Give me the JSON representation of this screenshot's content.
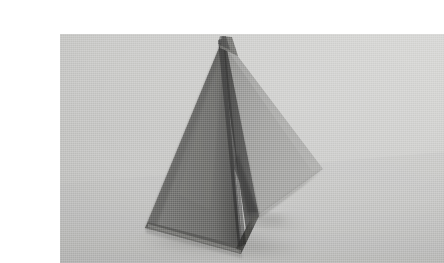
{
  "page": {
    "width": 424,
    "height": 262,
    "background_color": "#ffffff",
    "caption": ""
  },
  "photo": {
    "alt_text": "Folded paper pyramid standing on a plain surface",
    "subject": "origami-pyramid",
    "frame": {
      "x": 20,
      "y": 18,
      "width": 384,
      "height": 229
    },
    "palette": {
      "paper_white": "#ffffff",
      "background_light": "#d3d3d1",
      "background_mid": "#c6c6c4",
      "background_dark": "#b4b4b2",
      "face_left_dark": "#6f6f6d",
      "face_left_darker": "#5d5d5c",
      "face_right_mid": "#9a9a98",
      "face_right_light": "#a8a8a6",
      "inner_wedge": "#4a4a49",
      "crease_shadow": "#3a3a39",
      "ground_shadow": "#9d9d9b"
    },
    "geometry": {
      "apex": [
        183,
        22
      ],
      "left_base_corner": [
        105,
        212
      ],
      "bottom_center": [
        201,
        238
      ],
      "right_point": [
        283,
        153
      ],
      "right_base": [
        216,
        201
      ],
      "ridge_line": [
        [
          183,
          22
        ],
        [
          201,
          238
        ]
      ]
    },
    "lighting": {
      "key_direction": "upper-right",
      "shadow_direction": "lower-left",
      "contrast": "medium"
    }
  }
}
